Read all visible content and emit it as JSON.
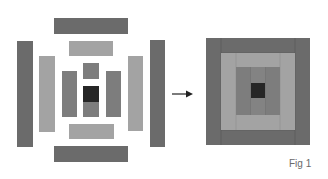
{
  "figure": {
    "label": "Fig 1",
    "colors": {
      "dark": "#6b6b6b",
      "light": "#a3a3a3",
      "medium": "#7d7d7d",
      "center": "#262626",
      "background": "#ffffff"
    },
    "left_exploded_pieces": [
      {
        "name": "outer-top-strip",
        "shade": "dark"
      },
      {
        "name": "outer-bottom-strip",
        "shade": "dark"
      },
      {
        "name": "outer-left-strip",
        "shade": "dark"
      },
      {
        "name": "outer-right-strip",
        "shade": "dark"
      },
      {
        "name": "middle-top-strip",
        "shade": "light"
      },
      {
        "name": "middle-bottom-strip",
        "shade": "light"
      },
      {
        "name": "middle-left-strip",
        "shade": "light"
      },
      {
        "name": "middle-right-strip",
        "shade": "light"
      },
      {
        "name": "inner-left-strip",
        "shade": "medium"
      },
      {
        "name": "inner-right-strip",
        "shade": "medium"
      },
      {
        "name": "inner-top-square",
        "shade": "medium"
      },
      {
        "name": "center-square",
        "shade": "center"
      },
      {
        "name": "inner-bottom-square",
        "shade": "medium"
      }
    ],
    "arrow": "right-arrow-icon",
    "right_assembled_block": "log-cabin-quilt-block"
  }
}
